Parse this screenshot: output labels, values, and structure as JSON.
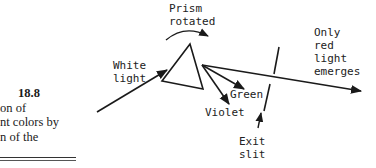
{
  "caption": {
    "figure_number": "18.8",
    "lines": [
      "on of",
      "nt colors by",
      "n of the"
    ]
  },
  "labels": {
    "prism_line1": "Prism",
    "prism_line2": "rotated",
    "white_line1": "White",
    "white_line2": "light",
    "green": "Green",
    "violet": "Violet",
    "exit_line1": "Exit",
    "exit_line2": "slit",
    "red_line1": "Only",
    "red_line2": "red",
    "red_line3": "light",
    "red_line4": "emerges"
  },
  "colors": {
    "ink": "#1a1a1a",
    "background": "#ffffff"
  }
}
